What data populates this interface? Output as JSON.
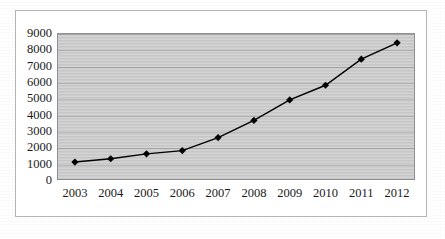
{
  "chart_data": {
    "type": "line",
    "title": "",
    "subtitle": "",
    "xlabel": "",
    "ylabel": "",
    "categories": [
      "2003",
      "2004",
      "2005",
      "2006",
      "2007",
      "2008",
      "2009",
      "2010",
      "2011",
      "2012"
    ],
    "x": [
      2003,
      2004,
      2005,
      2006,
      2007,
      2008,
      2009,
      2010,
      2011,
      2012
    ],
    "values": [
      1100,
      1300,
      1600,
      1800,
      2600,
      3650,
      4900,
      5800,
      7400,
      8400
    ],
    "series": [
      {
        "name": "",
        "values": [
          1100,
          1300,
          1600,
          1800,
          2600,
          3650,
          4900,
          5800,
          7400,
          8400
        ],
        "color": "#000000",
        "marker": "diamond",
        "line_style": "solid"
      }
    ],
    "ylim": [
      0,
      9000
    ],
    "ytick_labels": [
      "9000",
      "8000",
      "7000",
      "6000",
      "5000",
      "4000",
      "3000",
      "2000",
      "1000",
      "0"
    ],
    "yticks": [
      9000,
      8000,
      7000,
      6000,
      5000,
      4000,
      3000,
      2000,
      1000,
      0
    ],
    "ytick_step": 1000,
    "xtick_labels": [
      "2003",
      "2004",
      "2005",
      "2006",
      "2007",
      "2008",
      "2009",
      "2010",
      "2011",
      "2012"
    ],
    "grid": true,
    "grid_axis": "y",
    "legend": false,
    "legend_position": "none",
    "annotations": [],
    "colors": {
      "plot_background": "#c9c9c9",
      "page_background": "#ffffff",
      "gridline": "#a8a8a8",
      "series_line": "#000000",
      "marker": "#000000",
      "axis_border": "#8f8f8f",
      "frame_border": "#b4b4b4",
      "tick_text": "#1a1a1a"
    }
  }
}
